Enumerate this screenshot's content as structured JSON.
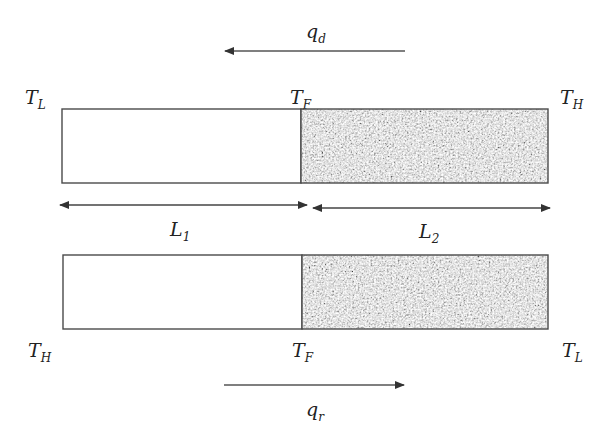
{
  "diagram": {
    "type": "two-layer thermal conduction schematic",
    "colors": {
      "stroke": "#4a4a4a",
      "plain_layer_fill": "#ffffff",
      "speckled_layer_base": "#8a8a8a",
      "text": "#222222"
    },
    "top_flow": {
      "label_main": "q",
      "label_sub": "d",
      "direction": "right-to-left"
    },
    "bottom_flow": {
      "label_main": "q",
      "label_sub": "r",
      "direction": "left-to-right"
    },
    "top_bar": {
      "left_temp": {
        "main": "T",
        "sub": "L"
      },
      "mid_temp": {
        "main": "T",
        "sub": "F"
      },
      "right_temp": {
        "main": "T",
        "sub": "H"
      },
      "left_layer": "plain",
      "right_layer": "speckled"
    },
    "bottom_bar": {
      "left_temp": {
        "main": "T",
        "sub": "H"
      },
      "mid_temp": {
        "main": "T",
        "sub": "F"
      },
      "right_temp": {
        "main": "T",
        "sub": "L"
      },
      "left_layer": "plain",
      "right_layer": "speckled"
    },
    "dimensions": [
      {
        "main": "L",
        "sub": "1"
      },
      {
        "main": "L",
        "sub": "2"
      }
    ]
  }
}
